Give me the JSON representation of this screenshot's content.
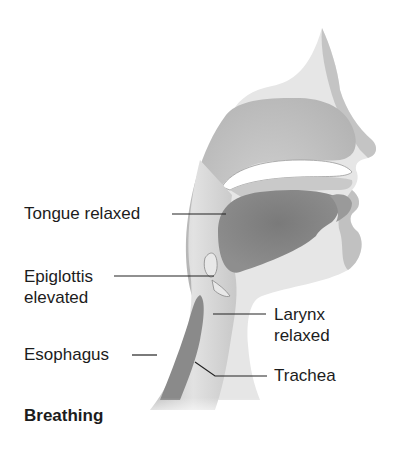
{
  "diagram": {
    "title": "Breathing",
    "labels": {
      "tongue": "Tongue relaxed",
      "epiglottis_line1": "Epiglottis",
      "epiglottis_line2": "elevated",
      "esophagus": "Esophagus",
      "larynx_line1": "Larynx",
      "larynx_line2": "relaxed",
      "trachea": "Trachea"
    },
    "colors": {
      "tissue_light": "#d9d9d9",
      "tissue_mid": "#bdbdbd",
      "tongue_dark": "#808080",
      "esophagus_dark": "#8a8a8a",
      "leader_line": "#222222",
      "background": "#ffffff"
    }
  }
}
